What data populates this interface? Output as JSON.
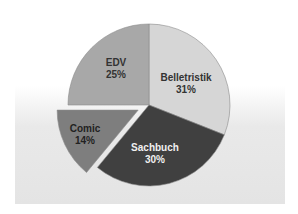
{
  "chart_data": {
    "type": "pie",
    "title": "",
    "categories": [
      "Belletristik",
      "Sachbuch",
      "Comic",
      "EDV"
    ],
    "values": [
      31,
      30,
      14,
      25
    ],
    "labels": [
      "31%",
      "30%",
      "14%",
      "25%"
    ],
    "colors": [
      "#d6d6d6",
      "#404040",
      "#7e7e7e",
      "#a8a8a8"
    ],
    "label_colors": [
      "#333333",
      "#f0f0f0",
      "#222222",
      "#333333"
    ],
    "exploded": [
      "Comic"
    ],
    "start_angle_deg": 0,
    "direction": "clockwise",
    "legend": "none"
  }
}
